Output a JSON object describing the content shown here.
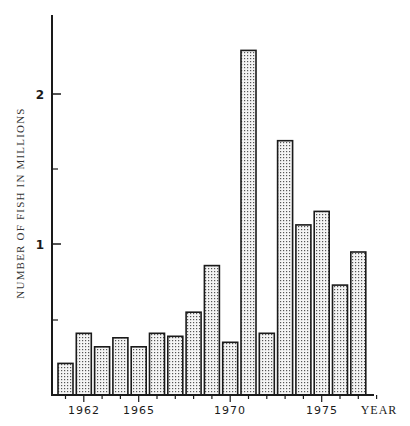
{
  "chart_data": {
    "type": "bar",
    "title": "",
    "xlabel": "YEAR",
    "ylabel": "NUMBER OF FISH IN MILLIONS",
    "categories": [
      "1961",
      "1962",
      "1963",
      "1964",
      "1965",
      "1966",
      "1967",
      "1968",
      "1969",
      "1970",
      "1971",
      "1972",
      "1973",
      "1974",
      "1975",
      "1976",
      "1977"
    ],
    "values": [
      0.21,
      0.41,
      0.32,
      0.38,
      0.32,
      0.41,
      0.39,
      0.55,
      0.86,
      0.35,
      2.29,
      0.41,
      1.69,
      1.13,
      1.22,
      0.73,
      0.95
    ],
    "x_tick_labels": [
      "1962",
      "1965",
      "1970",
      "1975"
    ],
    "y_tick_labels": [
      "1",
      "2"
    ],
    "y_minor_ticks": [
      0.5,
      1.5
    ],
    "ylim": [
      0,
      2.5
    ],
    "xlim": [
      1961,
      1978
    ],
    "grid": false,
    "legend": null,
    "bar_fill": "stippled dots",
    "colors": {
      "bar_stroke": "#1a1a1a",
      "bar_dot": "#555555",
      "bar_bg": "#f4f4f4",
      "axis": "#1a1a1a"
    }
  },
  "axis": {
    "x_title": "YEAR",
    "y_title": "NUMBER OF FISH IN MILLIONS",
    "y_labels": {
      "one": "1",
      "two": "2"
    },
    "x_labels": {
      "y1962": "1962",
      "y1965": "1965",
      "y1970": "1970",
      "y1975": "1975"
    }
  }
}
